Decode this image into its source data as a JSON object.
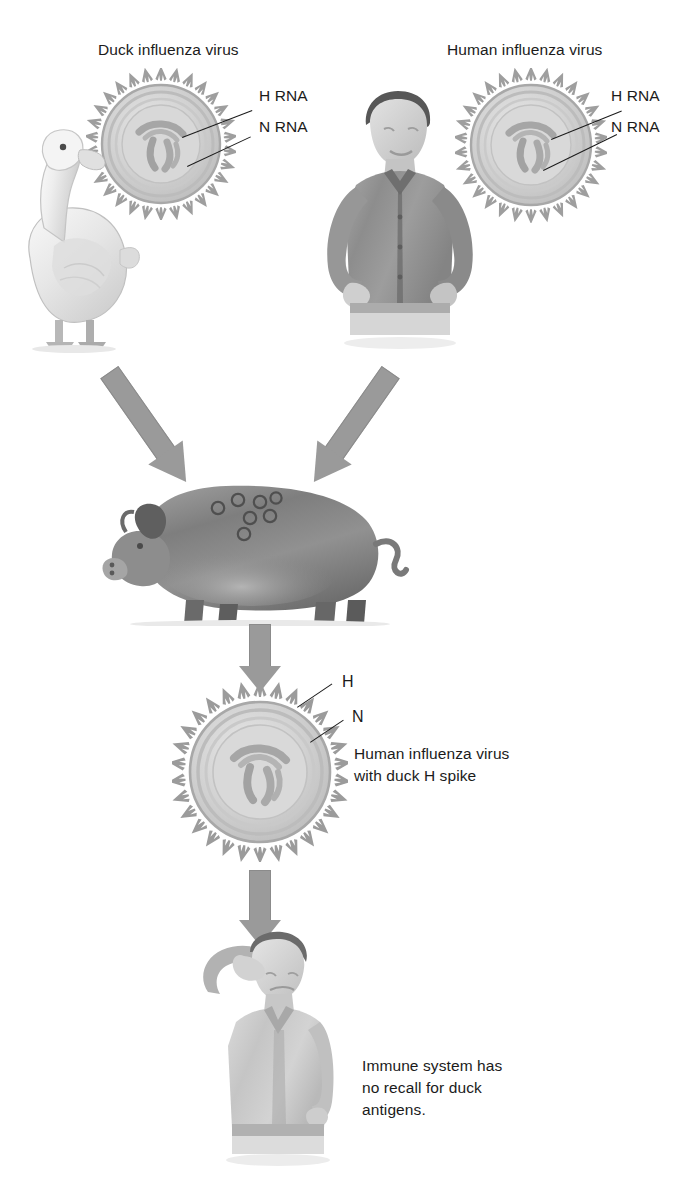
{
  "figure": {
    "background_color": "#ffffff",
    "text_color": "#1b1b1b",
    "arrow_color": "#9a9a9a",
    "virion_spike_color": "#9b9b9b",
    "virion_body_color": "#cfcfcf"
  },
  "labels": {
    "duck_virus_title": "Duck influenza virus",
    "human_virus_title": "Human influenza virus",
    "duck_h_rna": "H RNA",
    "duck_n_rna": "N RNA",
    "human_h_rna": "H RNA",
    "human_n_rna": "N RNA",
    "hybrid_h": "H",
    "hybrid_n": "N",
    "hybrid_caption_line1": "Human influenza virus",
    "hybrid_caption_line2": "with duck H spike",
    "outcome_line1": "Immune system has",
    "outcome_line2": "no recall for duck",
    "outcome_line3": "antigens."
  },
  "icons": {
    "duck": "duck-icon",
    "human_standing": "standing-man-icon",
    "pig": "pig-icon",
    "human_sick": "sick-man-icon",
    "virion_duck": "duck-virion-icon",
    "virion_human": "human-virion-icon",
    "virion_hybrid": "hybrid-virion-icon",
    "arrow_duck_to_pig": "diagonal-arrow-icon",
    "arrow_human_to_pig": "diagonal-arrow-icon",
    "arrow_pig_to_virion": "down-arrow-icon",
    "arrow_virion_to_human": "down-arrow-icon"
  },
  "flow": {
    "steps": [
      "Duck influenza virus",
      "Human influenza virus",
      "Pig co-infection / reassortment",
      "Human influenza virus with duck H spike",
      "Immune system has no recall for duck antigens."
    ]
  }
}
